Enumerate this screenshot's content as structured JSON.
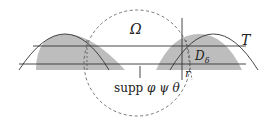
{
  "diagram": {
    "labels": {
      "omega": "Ω",
      "t": "T",
      "d_delta": "D",
      "d_delta_sub": "δ",
      "r": "r",
      "supp": "supp",
      "supp_funcs": "φ ψ θ"
    },
    "colors": {
      "shade": "#bdbdbd",
      "line": "#333333",
      "circle": "#555555",
      "background": "#ffffff"
    }
  }
}
